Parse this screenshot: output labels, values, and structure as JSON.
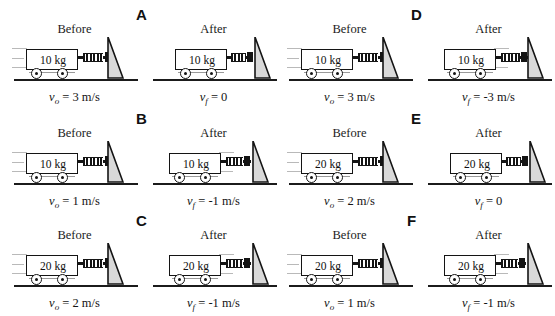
{
  "figure": {
    "labels": {
      "before": "Before",
      "after": "After",
      "v_symbol": "v",
      "sub_initial": "o",
      "sub_final": "f"
    },
    "panels": [
      {
        "letter": "A",
        "before": {
          "title": "Before",
          "mass": "10 kg",
          "v_sub": "o",
          "v_value": "= 3 m/s",
          "caption": "v_o = 3 m/s"
        },
        "after": {
          "title": "After",
          "mass": "10 kg",
          "v_sub": "f",
          "v_value": "= 0",
          "caption": "v_f = 0"
        }
      },
      {
        "letter": "B",
        "before": {
          "title": "Before",
          "mass": "10 kg",
          "v_sub": "o",
          "v_value": "= 1 m/s",
          "caption": "v_o = 1 m/s"
        },
        "after": {
          "title": "After",
          "mass": "10 kg",
          "v_sub": "f",
          "v_value": "= -1 m/s",
          "caption": "v_f = -1 m/s"
        }
      },
      {
        "letter": "C",
        "before": {
          "title": "Before",
          "mass": "20 kg",
          "v_sub": "o",
          "v_value": "= 2 m/s",
          "caption": "v_o = 2 m/s"
        },
        "after": {
          "title": "After",
          "mass": "20 kg",
          "v_sub": "f",
          "v_value": "= -1 m/s",
          "caption": "v_f = -1 m/s"
        }
      },
      {
        "letter": "D",
        "before": {
          "title": "Before",
          "mass": "10 kg",
          "v_sub": "o",
          "v_value": "= 3 m/s",
          "caption": "v_o = 3 m/s"
        },
        "after": {
          "title": "After",
          "mass": "10 kg",
          "v_sub": "f",
          "v_value": "= -3 m/s",
          "caption": "v_f = -3 m/s"
        }
      },
      {
        "letter": "E",
        "before": {
          "title": "Before",
          "mass": "20 kg",
          "v_sub": "o",
          "v_value": "= 2 m/s",
          "caption": "v_o = 2 m/s"
        },
        "after": {
          "title": "After",
          "mass": "20 kg",
          "v_sub": "f",
          "v_value": "= 0",
          "caption": "v_f = 0"
        }
      },
      {
        "letter": "F",
        "before": {
          "title": "Before",
          "mass": "20 kg",
          "v_sub": "o",
          "v_value": "= 1 m/s",
          "caption": "v_o = 1 m/s"
        },
        "after": {
          "title": "After",
          "mass": "20 kg",
          "v_sub": "f",
          "v_value": "= -1 m/s",
          "caption": "v_f = -1 m/s"
        }
      }
    ],
    "colors": {
      "ink": "#141414",
      "wall_fill": "#d9d9d9",
      "wall_stroke": "#141414",
      "speed_line": "#b9b9b9",
      "background": "#ffffff"
    }
  }
}
